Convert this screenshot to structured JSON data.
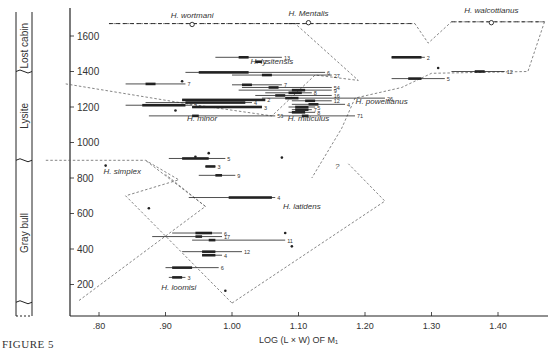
{
  "figure_label": "FIGURE 5",
  "chart_data": {
    "type": "scatter",
    "title": "",
    "xlabel": "LOG (L × W) OF M₁",
    "ylabel": "Stratigraphic level (ft)",
    "xlim": [
      0.72,
      1.47
    ],
    "ylim": [
      30,
      1700
    ],
    "xticks": [
      ".80",
      ".90",
      "1.00",
      "1.10",
      "1.20",
      "1.30",
      "1.40"
    ],
    "xtick_values": [
      0.8,
      0.9,
      1.0,
      1.1,
      1.2,
      1.3,
      1.4
    ],
    "yticks": [
      "200",
      "400",
      "600",
      "800",
      "1000",
      "1200",
      "1400",
      "1600"
    ],
    "ytick_values": [
      200,
      400,
      600,
      800,
      1000,
      1200,
      1400,
      1600
    ],
    "formations": [
      {
        "name": "Gray bull",
        "from": 30,
        "to": 900
      },
      {
        "name": "Lysite",
        "from": 900,
        "to": 1400
      },
      {
        "name": "Lost cabin",
        "from": 1400,
        "to": 1700
      }
    ],
    "species_labels": [
      {
        "name": "H. wortmani",
        "x": 0.94,
        "y": 1700
      },
      {
        "name": "H. Mentalis",
        "x": 1.115,
        "y": 1710
      },
      {
        "name": "H. walcottianus",
        "x": 1.39,
        "y": 1730
      },
      {
        "name": "H. lysitensis",
        "x": 1.06,
        "y": 1440
      },
      {
        "name": "H. powellianus",
        "x": 1.225,
        "y": 1215
      },
      {
        "name": "H. minor",
        "x": 0.955,
        "y": 1120
      },
      {
        "name": "H. miticulus",
        "x": 1.115,
        "y": 1120
      },
      {
        "name": "H. simplex",
        "x": 0.835,
        "y": 820
      },
      {
        "name": "H. latidens",
        "x": 1.105,
        "y": 625
      },
      {
        "name": "H. loomisi",
        "x": 0.92,
        "y": 170
      }
    ],
    "sample_ranges": [
      {
        "level": 1480,
        "min": 1.24,
        "max": 1.29,
        "mean_lo": 1.24,
        "mean_hi": 1.285,
        "n": "2"
      },
      {
        "level": 1480,
        "min": 0.975,
        "max": 1.075,
        "mean_lo": 1.01,
        "mean_hi": 1.025,
        "n": "13"
      },
      {
        "level": 1455,
        "min": 1.035,
        "max": 1.045,
        "mean_lo": 1.035,
        "mean_hi": 1.045,
        "n": "2"
      },
      {
        "level": 1395,
        "min": 0.93,
        "max": 1.14,
        "mean_lo": 0.95,
        "mean_hi": 1.025,
        "n": "6"
      },
      {
        "level": 1380,
        "min": 1.0,
        "max": 1.15,
        "mean_lo": 1.045,
        "mean_hi": 1.06,
        "n": "27"
      },
      {
        "level": 1400,
        "min": 1.33,
        "max": 1.41,
        "mean_lo": 1.365,
        "mean_hi": 1.38,
        "n": "12"
      },
      {
        "level": 1360,
        "min": 1.24,
        "max": 1.32,
        "mean_lo": 1.265,
        "mean_hi": 1.285,
        "n": "5"
      },
      {
        "level": 1330,
        "min": 0.84,
        "max": 0.93,
        "mean_lo": 0.87,
        "mean_hi": 0.885,
        "n": "7"
      },
      {
        "level": 1325,
        "min": 1.0,
        "max": 1.075,
        "mean_lo": 1.015,
        "mean_hi": 1.03,
        "n": "7"
      },
      {
        "level": 1310,
        "min": 1.015,
        "max": 1.15,
        "mean_lo": 1.055,
        "mean_hi": 1.07,
        "n": "54"
      },
      {
        "level": 1295,
        "min": 1.01,
        "max": 1.15,
        "mean_lo": 1.09,
        "mean_hi": 1.11,
        "n": "9"
      },
      {
        "level": 1280,
        "min": 1.05,
        "max": 1.12,
        "mean_lo": 1.085,
        "mean_hi": 1.105,
        "n": "8"
      },
      {
        "level": 1265,
        "min": 1.035,
        "max": 1.15,
        "mean_lo": 1.065,
        "mean_hi": 1.08,
        "n": "16"
      },
      {
        "level": 1250,
        "min": 1.045,
        "max": 1.23,
        "mean_lo": 1.08,
        "mean_hi": 1.1,
        "n": "26"
      },
      {
        "level": 1240,
        "min": 0.925,
        "max": 1.05,
        "mean_lo": 0.925,
        "mean_hi": 1.05,
        "n": "2"
      },
      {
        "level": 1225,
        "min": 0.87,
        "max": 1.03,
        "mean_lo": 0.93,
        "mean_hi": 1.02,
        "n": "4"
      },
      {
        "level": 1235,
        "min": 1.09,
        "max": 1.15,
        "mean_lo": 1.11,
        "mean_hi": 1.125,
        "n": "12"
      },
      {
        "level": 1215,
        "min": 1.09,
        "max": 1.17,
        "mean_lo": 1.115,
        "mean_hi": 1.13,
        "n": "4"
      },
      {
        "level": 1210,
        "min": 0.84,
        "max": 0.94,
        "mean_lo": 0.865,
        "mean_hi": 0.93,
        "n": "2"
      },
      {
        "level": 1200,
        "min": 0.94,
        "max": 1.045,
        "mean_lo": 0.94,
        "mean_hi": 1.045,
        "n": "3"
      },
      {
        "level": 1200,
        "min": 1.085,
        "max": 1.125,
        "mean_lo": 1.095,
        "mean_hi": 1.115,
        "n": "5"
      },
      {
        "level": 1185,
        "min": 1.09,
        "max": 1.12,
        "mean_lo": 1.095,
        "mean_hi": 1.115,
        "n": "7"
      },
      {
        "level": 1170,
        "min": 1.085,
        "max": 1.125,
        "mean_lo": 1.09,
        "mean_hi": 1.11,
        "n": "8"
      },
      {
        "level": 1150,
        "min": 0.875,
        "max": 1.065,
        "mean_lo": 0.94,
        "mean_hi": 0.95,
        "n": "56"
      },
      {
        "level": 1150,
        "min": 1.075,
        "max": 1.185,
        "mean_lo": 1.105,
        "mean_hi": 1.115,
        "n": "71"
      },
      {
        "level": 910,
        "min": 0.905,
        "max": 0.99,
        "mean_lo": 0.925,
        "mean_hi": 0.965,
        "n": "5"
      },
      {
        "level": 865,
        "min": 0.96,
        "max": 0.975,
        "mean_lo": 0.96,
        "mean_hi": 0.975,
        "n": "3"
      },
      {
        "level": 815,
        "min": 0.95,
        "max": 1.005,
        "mean_lo": 0.975,
        "mean_hi": 0.985,
        "n": "9"
      },
      {
        "level": 690,
        "min": 0.935,
        "max": 1.065,
        "mean_lo": 0.995,
        "mean_hi": 1.06,
        "n": "4"
      },
      {
        "level": 490,
        "min": 0.91,
        "max": 0.985,
        "mean_lo": 0.945,
        "mean_hi": 0.97,
        "n": "6"
      },
      {
        "level": 470,
        "min": 0.88,
        "max": 0.985,
        "mean_lo": 0.945,
        "mean_hi": 0.955,
        "n": "17"
      },
      {
        "level": 450,
        "min": 0.94,
        "max": 1.08,
        "mean_lo": 0.965,
        "mean_hi": 0.975,
        "n": "11"
      },
      {
        "level": 385,
        "min": 0.925,
        "max": 1.015,
        "mean_lo": 0.955,
        "mean_hi": 0.975,
        "n": "12"
      },
      {
        "level": 365,
        "min": 0.955,
        "max": 0.985,
        "mean_lo": 0.955,
        "mean_hi": 0.975,
        "n": "4"
      },
      {
        "level": 295,
        "min": 0.9,
        "max": 0.98,
        "mean_lo": 0.91,
        "mean_hi": 0.94,
        "n": "6"
      },
      {
        "level": 240,
        "min": 0.905,
        "max": 0.93,
        "mean_lo": 0.91,
        "mean_hi": 0.925,
        "n": "3"
      }
    ],
    "single_points": [
      {
        "x": 0.925,
        "y": 1345
      },
      {
        "x": 0.915,
        "y": 1180
      },
      {
        "x": 1.31,
        "y": 1420
      },
      {
        "x": 0.81,
        "y": 870
      },
      {
        "x": 0.945,
        "y": 920
      },
      {
        "x": 0.965,
        "y": 940
      },
      {
        "x": 1.075,
        "y": 915
      },
      {
        "x": 0.875,
        "y": 630
      },
      {
        "x": 1.08,
        "y": 490
      },
      {
        "x": 1.09,
        "y": 415
      },
      {
        "x": 0.99,
        "y": 165
      }
    ],
    "type_specimens": [
      {
        "x": 0.94,
        "y": 1665,
        "label": "H. wortmani"
      },
      {
        "x": 1.115,
        "y": 1675,
        "label": "H. Mentalis"
      },
      {
        "x": 1.39,
        "y": 1675,
        "label": "H. walcottianus"
      }
    ],
    "annotations": [
      "?"
    ],
    "grid": false,
    "legend": "none"
  }
}
